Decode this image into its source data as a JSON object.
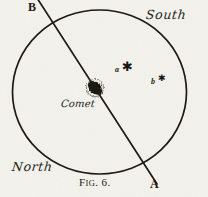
{
  "figure": {
    "caption_prefix": "F",
    "caption_rest": "IG",
    "caption_number": ". 6.",
    "caption_full": "FIG. 6.",
    "background_color": "#f4f2ec",
    "ink_color": "#1a1713"
  },
  "endpoints": {
    "top_label": "B",
    "bottom_label": "A"
  },
  "cardinals": {
    "top_right": "South",
    "bottom_left": "North"
  },
  "comet": {
    "label": "Comet"
  },
  "stars": [
    {
      "letter": "a",
      "glyph": "✱",
      "size": 13
    },
    {
      "letter": "b",
      "glyph": "✱",
      "size": 9
    }
  ]
}
